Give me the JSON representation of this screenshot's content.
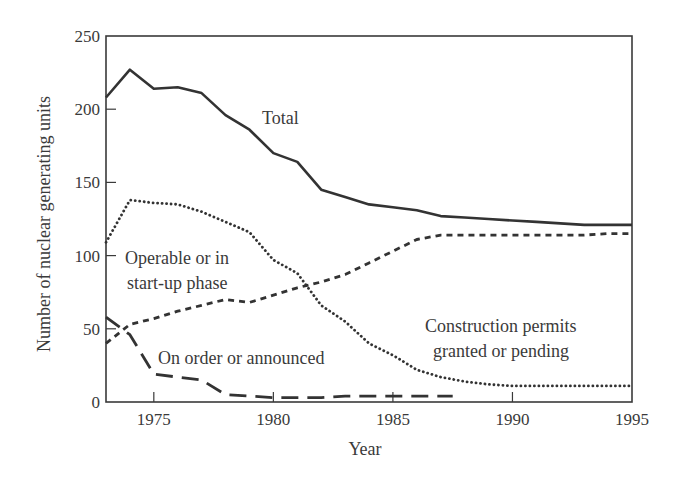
{
  "chart_data": {
    "type": "line",
    "title": "",
    "xlabel": "Year",
    "ylabel": "Number of nuclear generating units",
    "xlim": [
      1973,
      1995
    ],
    "ylim": [
      0,
      250
    ],
    "xticks": [
      1975,
      1980,
      1985,
      1990,
      1995
    ],
    "yticks": [
      0,
      50,
      100,
      150,
      200,
      250
    ],
    "grid": false,
    "legend": "none (inline annotations)",
    "series": [
      {
        "name": "Total",
        "style": "solid",
        "x": [
          1973,
          1974,
          1975,
          1976,
          1977,
          1978,
          1979,
          1980,
          1981,
          1982,
          1983,
          1984,
          1985,
          1986,
          1987,
          1988,
          1989,
          1990,
          1991,
          1992,
          1993,
          1994,
          1995
        ],
        "values": [
          208,
          227,
          214,
          215,
          211,
          196,
          186,
          170,
          164,
          145,
          140,
          135,
          133,
          131,
          127,
          126,
          125,
          124,
          123,
          122,
          121,
          121,
          121
        ]
      },
      {
        "name": "Construction permits granted or pending",
        "style": "dotted",
        "x": [
          1973,
          1974,
          1975,
          1976,
          1977,
          1978,
          1979,
          1980,
          1981,
          1982,
          1983,
          1984,
          1985,
          1986,
          1987,
          1988,
          1989,
          1990,
          1991,
          1992,
          1993,
          1994,
          1995
        ],
        "values": [
          109,
          138,
          136,
          135,
          130,
          123,
          116,
          97,
          88,
          66,
          55,
          40,
          32,
          22,
          17,
          14,
          12,
          11,
          11,
          11,
          11,
          11,
          11
        ]
      },
      {
        "name": "Operable or in start-up phase",
        "style": "short-dashed",
        "x": [
          1973,
          1974,
          1975,
          1976,
          1977,
          1978,
          1979,
          1980,
          1981,
          1982,
          1983,
          1984,
          1985,
          1986,
          1987,
          1988,
          1989,
          1990,
          1991,
          1992,
          1993,
          1994,
          1995
        ],
        "values": [
          40,
          53,
          57,
          62,
          66,
          70,
          68,
          73,
          78,
          82,
          87,
          95,
          103,
          111,
          114,
          114,
          114,
          114,
          114,
          114,
          114,
          115,
          115
        ]
      },
      {
        "name": "On order or announced",
        "style": "long-dashed",
        "x": [
          1973,
          1974,
          1975,
          1976,
          1977,
          1978,
          1979,
          1980,
          1981,
          1982,
          1983,
          1984,
          1985,
          1986,
          1987,
          1987.5
        ],
        "values": [
          58,
          46,
          19,
          17,
          15,
          5,
          4,
          3,
          3,
          3,
          4,
          4,
          4,
          4,
          4,
          4
        ]
      }
    ],
    "annotations": [
      {
        "text": "Total",
        "x": 1978.6,
        "y": 193
      },
      {
        "text": [
          "Operable or in",
          "start-up phase"
        ],
        "x": 1973.8,
        "y": 98
      },
      {
        "text": "On order or announced",
        "x": 1975.4,
        "y": 25
      },
      {
        "text": [
          "Construction permits",
          "granted or pending"
        ],
        "x": 1985.3,
        "y": 48
      }
    ]
  },
  "labels": {
    "xlabel": "Year",
    "ylabel": "Number of nuclear generating units",
    "total": "Total",
    "operable_1": "Operable or in",
    "operable_2": "start-up phase",
    "onorder": "On order or announced",
    "construction_1": "Construction permits",
    "construction_2": "granted or pending"
  }
}
